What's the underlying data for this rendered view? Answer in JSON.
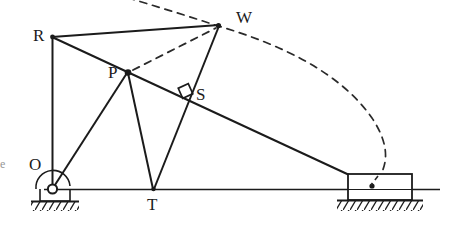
{
  "figure": {
    "kind": "mechanism-linkage-diagram",
    "width": 454,
    "height": 248,
    "ink_color": "#1b1b1b",
    "background_color": "#ffffff",
    "dashed_color": "#2a2a2a"
  },
  "labels": {
    "R": "R",
    "W": "W",
    "P": "P",
    "S": "S",
    "O": "O",
    "T": "T",
    "edge_mark": "e"
  },
  "points": {
    "O": {
      "name": "O",
      "x": 52,
      "y": 189,
      "role": "fixed-pivot"
    },
    "R": {
      "name": "R",
      "x": 52,
      "y": 37,
      "role": "joint"
    },
    "W": {
      "name": "W",
      "x": 218,
      "y": 25,
      "role": "joint"
    },
    "P": {
      "name": "P",
      "x": 128,
      "y": 72,
      "role": "joint"
    },
    "S": {
      "name": "S",
      "x": 186,
      "y": 93,
      "role": "sliding-joint"
    },
    "T": {
      "name": "T",
      "x": 153,
      "y": 189,
      "role": "joint-on-ground-line"
    },
    "Q": {
      "name": "Q",
      "x": 372,
      "y": 186,
      "role": "slider-block-pin"
    }
  },
  "links": [
    {
      "name": "link-O-R",
      "from": "O",
      "to": "R",
      "style": "solid"
    },
    {
      "name": "link-R-W",
      "from": "R",
      "to": "W",
      "style": "solid"
    },
    {
      "name": "link-R-slider",
      "from": "R",
      "to": "Q",
      "style": "solid"
    },
    {
      "name": "link-W-T",
      "from": "W",
      "to": "T",
      "style": "solid"
    },
    {
      "name": "link-P-T",
      "from": "P",
      "to": "T",
      "style": "solid"
    },
    {
      "name": "link-O-P",
      "from": "O",
      "to": "P",
      "style": "solid"
    },
    {
      "name": "link-P-W",
      "from": "P",
      "to": "W",
      "style": "dashed"
    }
  ],
  "ground_line": {
    "name": "ground-line",
    "x1": 44,
    "y1": 189,
    "x2": 440,
    "y2": 189
  },
  "arc": {
    "name": "dashed-locus-arc",
    "description": "dashed circular locus passing through W and descending to the slider",
    "style": "dashed"
  },
  "markers": {
    "right_angle_at_S": true,
    "angle_arc_at_O": true,
    "pin_support_at_O": true,
    "slider_block": {
      "x": 348,
      "y": 174,
      "width": 64,
      "height": 26
    },
    "hatched_ground_left": true,
    "hatched_ground_right": true
  }
}
